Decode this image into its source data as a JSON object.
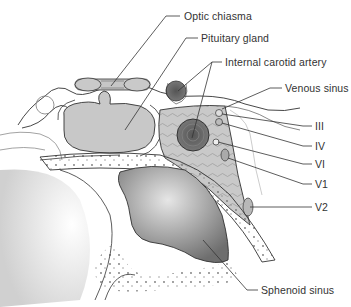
{
  "diagram": {
    "labels": {
      "optic_chiasma": "Optic chiasma",
      "pituitary_gland": "Pituitary gland",
      "internal_carotid_artery": "Internal carotid artery",
      "venous_sinus": "Venous sinus",
      "cn_iii": "III",
      "cn_iv": "IV",
      "cn_vi": "VI",
      "cn_v1": "V1",
      "cn_v2": "V2",
      "sphenoid_sinus": "Sphenoid sinus"
    },
    "colors": {
      "line": "#333333",
      "gland": "#c8c8c8",
      "artery": "#6a6a6a",
      "sinus_dark": "#707070",
      "sinus_light": "#d8d8d8",
      "venous": "#bdbdbd"
    }
  }
}
